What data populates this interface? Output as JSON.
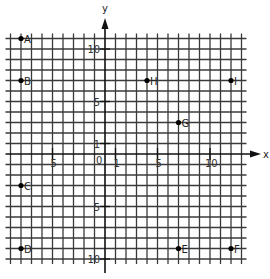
{
  "chart_data": {
    "type": "scatter",
    "title": "",
    "xlabel": "x",
    "ylabel": "y",
    "xlim": [
      -9,
      13
    ],
    "ylim": [
      -10,
      11
    ],
    "grid": true,
    "grid_step": 1,
    "x_tick_labels": [
      {
        "value": -5,
        "label": "5"
      },
      {
        "value": 0,
        "label": "0"
      },
      {
        "value": 1,
        "label": "1"
      },
      {
        "value": 5,
        "label": "5"
      },
      {
        "value": 10,
        "label": "10"
      }
    ],
    "y_tick_labels": [
      {
        "value": 10,
        "label": "10"
      },
      {
        "value": 5,
        "label": "5"
      },
      {
        "value": 1,
        "label": "1"
      },
      {
        "value": -5,
        "label": "5"
      },
      {
        "value": -10,
        "label": "10"
      }
    ],
    "points": [
      {
        "label": "A",
        "x": -8,
        "y": 11
      },
      {
        "label": "B",
        "x": -8,
        "y": 7
      },
      {
        "label": "C",
        "x": -8,
        "y": -3
      },
      {
        "label": "D",
        "x": -8,
        "y": -9
      },
      {
        "label": "E",
        "x": 7,
        "y": -9
      },
      {
        "label": "F",
        "x": 12,
        "y": -9
      },
      {
        "label": "G",
        "x": 7,
        "y": 3
      },
      {
        "label": "H",
        "x": 4,
        "y": 7
      },
      {
        "label": "I",
        "x": 12,
        "y": 7
      }
    ]
  },
  "layout": {
    "origin_px": [
      105,
      154
    ],
    "unit_px": 10.5
  }
}
